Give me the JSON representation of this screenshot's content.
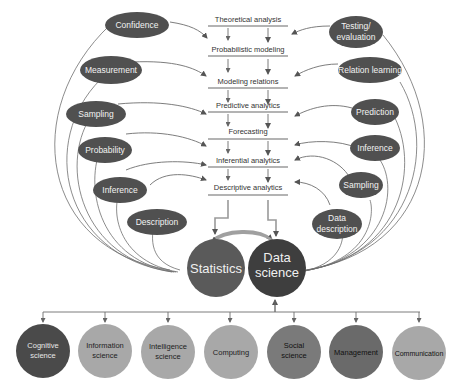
{
  "stages": [
    {
      "label": "Theoretical analysis"
    },
    {
      "label": "Probabilistic modeling"
    },
    {
      "label": "Modeling relations"
    },
    {
      "label": "Predictive analytics"
    },
    {
      "label": "Forecasting"
    },
    {
      "label": "Inferential analytics"
    },
    {
      "label": "Descriptive analytics"
    }
  ],
  "left_concepts": [
    {
      "label": "Confidence"
    },
    {
      "label": "Measurement"
    },
    {
      "label": "Sampling"
    },
    {
      "label": "Probability"
    },
    {
      "label": "Inference"
    },
    {
      "label": "Description"
    }
  ],
  "right_concepts": [
    {
      "line1": "Testing/",
      "line2": "evaluation"
    },
    {
      "line1": "Relation learning",
      "line2": ""
    },
    {
      "line1": "Prediction",
      "line2": ""
    },
    {
      "line1": "Inference",
      "line2": ""
    },
    {
      "line1": "Sampling",
      "line2": ""
    },
    {
      "line1": "Data",
      "line2": "description"
    }
  ],
  "core": {
    "statistics": "Statistics",
    "data_science_line1": "Data",
    "data_science_line2": "science"
  },
  "fields": [
    {
      "line1": "Cognitive",
      "line2": "science",
      "color": "#4a4a4a",
      "text_color": "#e8e8e8"
    },
    {
      "line1": "Information",
      "line2": "science",
      "color": "#a8a8a8",
      "text_color": "#222222"
    },
    {
      "line1": "Intelligence",
      "line2": "science",
      "color": "#a8a8a8",
      "text_color": "#222222"
    },
    {
      "line1": "Computing",
      "line2": "",
      "color": "#a8a8a8",
      "text_color": "#222222"
    },
    {
      "line1": "Social",
      "line2": "science",
      "color": "#7a7a7a",
      "text_color": "#111111"
    },
    {
      "line1": "Management",
      "line2": "",
      "color": "#6a6a6a",
      "text_color": "#111111"
    },
    {
      "line1": "Communication",
      "line2": "",
      "color": "#a8a8a8",
      "text_color": "#111111"
    }
  ],
  "colors": {
    "oval": "#505050",
    "statistics": "#5a5a5a",
    "data_science": "#3e3e3e"
  }
}
